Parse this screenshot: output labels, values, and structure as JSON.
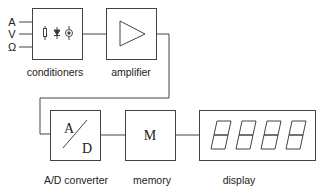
{
  "diagram": {
    "inputs": [
      "A",
      "V",
      "Ω"
    ],
    "blocks": [
      {
        "id": "conditioners",
        "label": "conditioners"
      },
      {
        "id": "amplifier",
        "label": "amplifier"
      },
      {
        "id": "adc",
        "label": "A/D converter",
        "symbol_top": "A",
        "symbol_bottom": "D"
      },
      {
        "id": "memory",
        "label": "memory",
        "symbol": "M"
      },
      {
        "id": "display",
        "label": "display",
        "digits": "8888"
      }
    ],
    "connections": [
      [
        "inputs",
        "conditioners"
      ],
      [
        "conditioners",
        "amplifier"
      ],
      [
        "amplifier",
        "adc"
      ],
      [
        "adc",
        "memory"
      ],
      [
        "memory",
        "display"
      ]
    ],
    "colors": {
      "stroke": "#444444",
      "background": "#ffffff"
    }
  }
}
